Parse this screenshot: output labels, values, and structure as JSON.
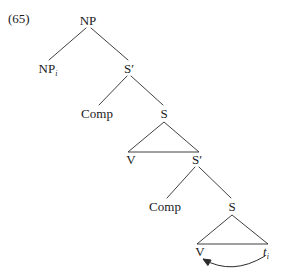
{
  "figure": {
    "example_number": "(65)",
    "caption": "",
    "ink_color": "#2b2b2b",
    "background_color": "#ffffff"
  },
  "tree": {
    "nodes": [
      {
        "id": "np-root",
        "label": "NP",
        "sub": "",
        "x": 88,
        "y": 20,
        "name": "node-np-root"
      },
      {
        "id": "np-i",
        "label": "NP",
        "sub": "i",
        "x": 48,
        "y": 68,
        "name": "node-np-moved"
      },
      {
        "id": "sbar-1",
        "label": "S′",
        "sub": "",
        "x": 129,
        "y": 68,
        "name": "node-sbar-1"
      },
      {
        "id": "comp-1",
        "label": "Comp",
        "sub": "",
        "x": 97,
        "y": 113,
        "name": "node-comp-1"
      },
      {
        "id": "s-1",
        "label": "S",
        "sub": "",
        "x": 164,
        "y": 113,
        "name": "node-s-1"
      },
      {
        "id": "v-1",
        "label": "V",
        "sub": "",
        "x": 131,
        "y": 159,
        "name": "node-v-1"
      },
      {
        "id": "sbar-2",
        "label": "S′",
        "sub": "",
        "x": 197,
        "y": 159,
        "name": "node-sbar-2"
      },
      {
        "id": "comp-2",
        "label": "Comp",
        "sub": "",
        "x": 165,
        "y": 206,
        "name": "node-comp-2"
      },
      {
        "id": "s-2",
        "label": "S",
        "sub": "",
        "x": 232,
        "y": 206,
        "name": "node-s-2"
      },
      {
        "id": "v-2",
        "label": "V",
        "sub": "",
        "x": 200,
        "y": 251,
        "name": "node-v-2"
      },
      {
        "id": "trace",
        "label": "t",
        "sub": "i",
        "x": 266,
        "y": 251,
        "name": "node-trace",
        "italic": true
      }
    ],
    "branches": [
      {
        "from": "np-root",
        "to": "np-i",
        "x1": 86,
        "y1": 28,
        "x2": 49,
        "y2": 60,
        "name": "branch-np-to-npi"
      },
      {
        "from": "np-root",
        "to": "sbar-1",
        "x1": 91,
        "y1": 28,
        "x2": 128,
        "y2": 60,
        "name": "branch-np-to-sbar1"
      },
      {
        "from": "sbar-1",
        "to": "comp-1",
        "x1": 127,
        "y1": 76,
        "x2": 99,
        "y2": 105,
        "name": "branch-sbar1-to-comp1"
      },
      {
        "from": "sbar-1",
        "to": "s-1",
        "x1": 131,
        "y1": 76,
        "x2": 163,
        "y2": 105,
        "name": "branch-sbar1-to-s1"
      },
      {
        "from": "sbar-2",
        "to": "comp-2",
        "x1": 195,
        "y1": 167,
        "x2": 167,
        "y2": 198,
        "name": "branch-sbar2-to-comp2"
      },
      {
        "from": "sbar-2",
        "to": "s-2",
        "x1": 199,
        "y1": 167,
        "x2": 231,
        "y2": 198,
        "name": "branch-sbar2-to-s2"
      }
    ],
    "triangles": [
      {
        "apex": "s-1",
        "left": "v-1",
        "right": "sbar-2",
        "ax": 164,
        "ay": 122,
        "lx": 128,
        "ly": 152,
        "rx": 199,
        "ry": 152,
        "name": "triangle-s1"
      },
      {
        "apex": "s-2",
        "left": "v-2",
        "right": "trace",
        "ax": 232,
        "ay": 215,
        "lx": 197,
        "ly": 244,
        "rx": 268,
        "ry": 244,
        "name": "triangle-s2"
      }
    ],
    "movement_arcs": [
      {
        "from": "trace",
        "to": "v-2",
        "start_x": 265,
        "start_y": 256,
        "ctrl_x": 232,
        "ctrl_y": 276,
        "end_x": 203,
        "end_y": 259,
        "name": "movement-arrow-trace-to-v"
      }
    ]
  }
}
